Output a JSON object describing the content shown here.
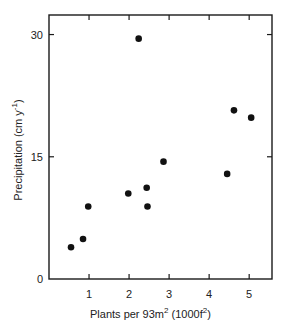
{
  "chart_data": {
    "type": "scatter",
    "title": "",
    "xlabel": "Plants per 93m² (1000f²)",
    "ylabel": "Precipitation (cm y⁻¹)",
    "xlim": [
      0,
      5.57
    ],
    "ylim": [
      0,
      32.4
    ],
    "x_ticks": [
      1,
      2,
      3,
      4,
      5
    ],
    "y_ticks": [
      0,
      15,
      30
    ],
    "x_tick_labels": [
      "1",
      "2",
      "3",
      "4",
      "5"
    ],
    "y_tick_labels": [
      "0",
      "15",
      "30"
    ],
    "grid": false,
    "legend": null,
    "series": [
      {
        "name": "observations",
        "marker": "filled-circle",
        "color": "#111111",
        "points": [
          {
            "x": 0.55,
            "y": 3.9
          },
          {
            "x": 0.85,
            "y": 4.9
          },
          {
            "x": 0.98,
            "y": 8.9
          },
          {
            "x": 1.98,
            "y": 10.5
          },
          {
            "x": 2.24,
            "y": 29.5
          },
          {
            "x": 2.44,
            "y": 11.2
          },
          {
            "x": 2.46,
            "y": 8.9
          },
          {
            "x": 2.86,
            "y": 14.4
          },
          {
            "x": 4.45,
            "y": 12.9
          },
          {
            "x": 4.62,
            "y": 20.7
          },
          {
            "x": 5.05,
            "y": 19.8
          }
        ]
      }
    ]
  },
  "labels": {
    "x_axis": {
      "main": "Plants per 93m",
      "sup1": "2",
      "mid": " (1000f",
      "sup2": "2",
      "end": ")"
    },
    "y_axis": {
      "main": "Precipitation (cm y",
      "sup": "-1",
      "end": ")"
    }
  }
}
